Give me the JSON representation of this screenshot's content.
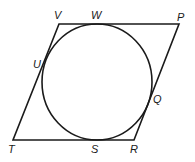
{
  "diagram": {
    "stroke_color": "#1a1a1a",
    "parallelogram": {
      "vertices": {
        "V": [
          59,
          24
        ],
        "P": [
          179,
          24
        ],
        "R": [
          134,
          140
        ],
        "T": [
          13,
          140
        ]
      }
    },
    "circle": {
      "cx": 97,
      "cy": 82,
      "rx": 55,
      "ry": 58
    },
    "labels": {
      "V": "V",
      "W": "W",
      "P": "P",
      "U": "U",
      "Q": "Q",
      "T": "T",
      "S": "S",
      "R": "R"
    }
  }
}
